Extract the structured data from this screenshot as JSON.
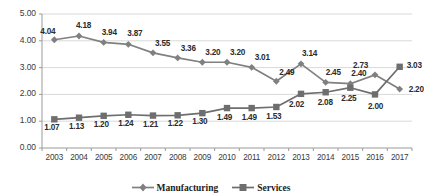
{
  "chart_data": {
    "type": "line",
    "title": "",
    "subtitle": "",
    "xlabel": "",
    "ylabel": "",
    "categories": [
      "2003",
      "2004",
      "2005",
      "2006",
      "2007",
      "2008",
      "2009",
      "2010",
      "2011",
      "2012",
      "2013",
      "2014",
      "2015",
      "2016",
      "2017"
    ],
    "series": [
      {
        "name": "Manufacturing",
        "marker": "diamond",
        "color": "#808080",
        "values": [
          4.04,
          4.18,
          3.94,
          3.87,
          3.55,
          3.36,
          3.2,
          3.2,
          3.01,
          2.49,
          3.14,
          2.45,
          2.4,
          2.73,
          2.2
        ],
        "labels": [
          "4.04",
          "4.18",
          "3.94",
          "3.87",
          "3.55",
          "3.36",
          "3.20",
          "3.20",
          "3.01",
          "2.49",
          "3.14",
          "2.45",
          "2.40",
          "2.73",
          "2.20"
        ]
      },
      {
        "name": "Services",
        "marker": "square",
        "color": "#6e6e6e",
        "values": [
          1.07,
          1.13,
          1.2,
          1.24,
          1.21,
          1.22,
          1.3,
          1.49,
          1.49,
          1.53,
          2.02,
          2.08,
          2.25,
          2.0,
          3.03
        ],
        "labels": [
          "1.07",
          "1.13",
          "1.20",
          "1.24",
          "1.21",
          "1.22",
          "1.30",
          "1.49",
          "1.49",
          "1.53",
          "2.02",
          "2.08",
          "2.25",
          "2.00",
          "3.03"
        ]
      }
    ],
    "ylim": [
      0,
      5
    ],
    "yticks": [
      "0.00",
      "1.00",
      "2.00",
      "3.00",
      "4.00",
      "5.00"
    ],
    "ytick_values": [
      0,
      1,
      2,
      3,
      4,
      5
    ],
    "grid": true,
    "grid_color": "#d9d9d9",
    "legend_position": "bottom",
    "legend": [
      "Manufacturing",
      "Services"
    ]
  }
}
